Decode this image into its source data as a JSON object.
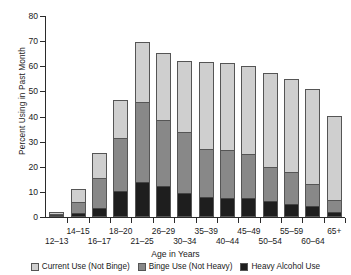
{
  "chart_data": {
    "type": "bar",
    "stacked": true,
    "title": "",
    "xlabel": "Age in Years",
    "ylabel": "Percent Using in Past Month",
    "ylim": [
      0,
      80
    ],
    "yticks": [
      0,
      10,
      20,
      30,
      40,
      50,
      60,
      70,
      80
    ],
    "grid": false,
    "legend_position": "bottom",
    "categories": [
      "12–13",
      "14–15",
      "16–17",
      "18–20",
      "21–25",
      "26–29",
      "30–34",
      "35–39",
      "40–44",
      "45–49",
      "50–54",
      "55–59",
      "60–64",
      "65+"
    ],
    "series": [
      {
        "name": "Heavy Alcohol Use",
        "color": "#1e1e1e",
        "values": [
          0.2,
          1.3,
          3.2,
          9.8,
          13.7,
          11.8,
          9.1,
          7.4,
          7.2,
          7.0,
          6.0,
          4.6,
          3.8,
          1.6
        ]
      },
      {
        "name": "Binge Use (Not Heavy)",
        "color": "#888888",
        "values": [
          0.7,
          4.1,
          11.9,
          21.4,
          31.7,
          26.4,
          24.3,
          19.3,
          19.1,
          17.5,
          13.4,
          12.8,
          9.0,
          4.8
        ]
      },
      {
        "name": "Current Use (Not Binge)",
        "color": "#cfcfcf",
        "values": [
          1.2,
          5.8,
          10.2,
          15.3,
          24.4,
          27.1,
          28.8,
          34.8,
          35.0,
          35.7,
          37.8,
          37.6,
          38.2,
          33.7
        ]
      }
    ],
    "cumulative_tops": {
      "heavy": [
        0.2,
        1.3,
        3.2,
        9.8,
        13.7,
        11.8,
        9.1,
        7.4,
        7.2,
        7.0,
        6.0,
        4.6,
        3.8,
        1.6
      ],
      "binge": [
        0.9,
        5.4,
        15.1,
        31.2,
        45.4,
        38.2,
        33.4,
        26.7,
        26.3,
        24.5,
        19.4,
        17.4,
        12.8,
        6.4
      ],
      "current": [
        2.1,
        11.2,
        25.3,
        46.5,
        69.8,
        65.3,
        62.2,
        61.5,
        61.3,
        60.2,
        57.2,
        55.0,
        51.0,
        40.1
      ]
    }
  },
  "legend": {
    "items": [
      {
        "label": "Current Use (Not Binge)",
        "color": "#cfcfcf"
      },
      {
        "label": "Binge Use (Not Heavy)",
        "color": "#888888"
      },
      {
        "label": "Heavy Alcohol Use",
        "color": "#1e1e1e"
      }
    ]
  }
}
